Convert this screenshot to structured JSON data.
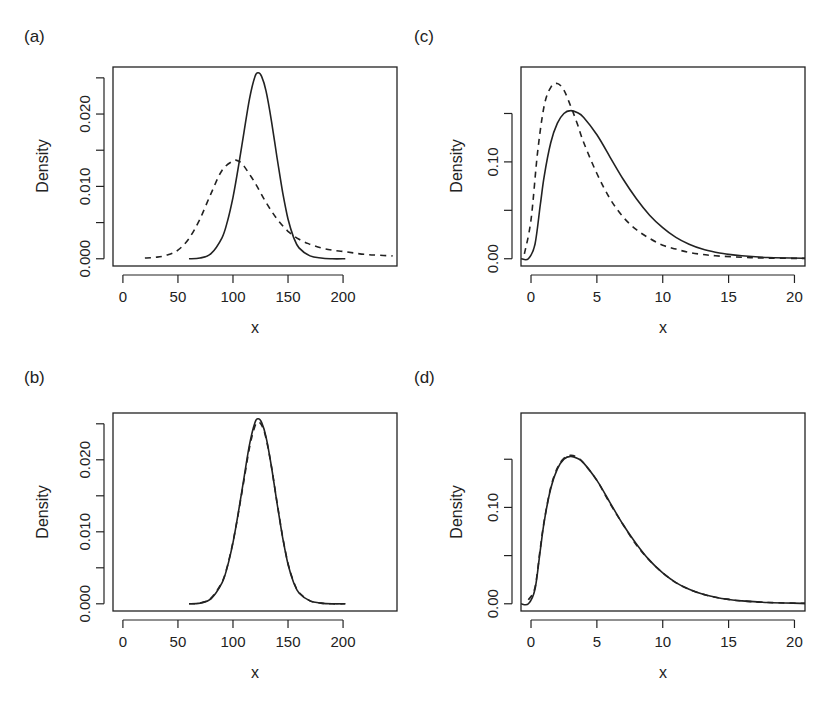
{
  "figure": {
    "panels": [
      {
        "id": "a",
        "label": "(a)",
        "xlabel": "x",
        "ylabel": "Density"
      },
      {
        "id": "b",
        "label": "(b)",
        "xlabel": "x",
        "ylabel": "Density"
      },
      {
        "id": "c",
        "label": "(c)",
        "xlabel": "x",
        "ylabel": "Density"
      },
      {
        "id": "d",
        "label": "(d)",
        "xlabel": "x",
        "ylabel": "Density"
      }
    ]
  },
  "chart_data": [
    {
      "panel": "(a)",
      "type": "line",
      "title": "",
      "xlabel": "x",
      "ylabel": "Density",
      "xlim": [
        -9,
        249
      ],
      "ylim": [
        -0.001,
        0.0265
      ],
      "xticks": [
        0,
        50,
        100,
        150,
        200
      ],
      "xtick_labels": [
        "0",
        "50",
        "100",
        "150",
        "200"
      ],
      "yticks": [
        0.0,
        0.005,
        0.01,
        0.015,
        0.02,
        0.025
      ],
      "ytick_labels": [
        "0.000",
        "",
        "0.010",
        "",
        "0.020",
        ""
      ],
      "grid": false,
      "series": [
        {
          "name": "solid",
          "style": "solid",
          "x": [
            60,
            70,
            80,
            90,
            95,
            100,
            105,
            110,
            115,
            120,
            123,
            126,
            130,
            135,
            140,
            145,
            150,
            155,
            160,
            170,
            180,
            190,
            202
          ],
          "y": [
            0.0,
            0.0001,
            0.0007,
            0.0029,
            0.0052,
            0.0085,
            0.0128,
            0.0175,
            0.0221,
            0.0252,
            0.0257,
            0.0252,
            0.0232,
            0.019,
            0.014,
            0.0093,
            0.0055,
            0.003,
            0.0015,
            0.0004,
            0.0001,
            0.0,
            0.0
          ]
        },
        {
          "name": "dashed",
          "style": "dashed",
          "x": [
            20,
            30,
            40,
            50,
            60,
            70,
            80,
            90,
            100,
            105,
            110,
            120,
            130,
            140,
            150,
            160,
            170,
            180,
            190,
            200,
            210,
            220,
            230,
            245
          ],
          "y": [
            0.0001,
            0.0002,
            0.0005,
            0.0012,
            0.0028,
            0.0055,
            0.009,
            0.0122,
            0.0135,
            0.0135,
            0.0128,
            0.0105,
            0.0078,
            0.0055,
            0.0038,
            0.0027,
            0.002,
            0.0015,
            0.0012,
            0.001,
            0.0008,
            0.0006,
            0.0005,
            0.0004
          ]
        }
      ]
    },
    {
      "panel": "(b)",
      "type": "line",
      "title": "",
      "xlabel": "x",
      "ylabel": "Density",
      "xlim": [
        -9,
        249
      ],
      "ylim": [
        -0.001,
        0.0265
      ],
      "xticks": [
        0,
        50,
        100,
        150,
        200
      ],
      "xtick_labels": [
        "0",
        "50",
        "100",
        "150",
        "200"
      ],
      "yticks": [
        0.0,
        0.005,
        0.01,
        0.015,
        0.02,
        0.025
      ],
      "ytick_labels": [
        "0.000",
        "",
        "0.010",
        "",
        "0.020",
        ""
      ],
      "grid": false,
      "series": [
        {
          "name": "solid",
          "style": "solid",
          "x": [
            60,
            70,
            80,
            90,
            95,
            100,
            105,
            110,
            115,
            120,
            123,
            126,
            130,
            135,
            140,
            145,
            150,
            155,
            160,
            170,
            180,
            190,
            202
          ],
          "y": [
            0.0,
            0.0001,
            0.0007,
            0.0029,
            0.0052,
            0.0085,
            0.0128,
            0.0175,
            0.0221,
            0.0252,
            0.0257,
            0.0252,
            0.0232,
            0.019,
            0.014,
            0.0093,
            0.0055,
            0.003,
            0.0015,
            0.0004,
            0.0001,
            0.0,
            0.0
          ]
        },
        {
          "name": "dashed",
          "style": "dashed",
          "x": [
            60,
            70,
            80,
            90,
            95,
            100,
            105,
            110,
            115,
            120,
            123,
            126,
            130,
            135,
            140,
            145,
            150,
            155,
            160,
            170,
            180,
            190,
            202
          ],
          "y": [
            0.0,
            0.0001,
            0.0008,
            0.003,
            0.0053,
            0.0086,
            0.0127,
            0.0172,
            0.0217,
            0.0247,
            0.0252,
            0.0248,
            0.023,
            0.019,
            0.0141,
            0.0094,
            0.0056,
            0.0031,
            0.0016,
            0.0004,
            0.0001,
            0.0,
            0.0
          ]
        }
      ]
    },
    {
      "panel": "(c)",
      "type": "line",
      "title": "",
      "xlabel": "x",
      "ylabel": "Density",
      "xlim": [
        -0.76,
        20.8
      ],
      "ylim": [
        -0.0075,
        0.198
      ],
      "xticks": [
        0,
        5,
        10,
        15,
        20
      ],
      "xtick_labels": [
        "0",
        "5",
        "10",
        "15",
        "20"
      ],
      "yticks": [
        0.0,
        0.05,
        0.1,
        0.15
      ],
      "ytick_labels": [
        "0.00",
        "",
        "0.10",
        ""
      ],
      "grid": false,
      "series": [
        {
          "name": "solid",
          "style": "solid",
          "x": [
            -0.75,
            -0.2,
            0.3,
            0.7,
            1.0,
            1.5,
            2.0,
            2.5,
            3.0,
            3.5,
            4.0,
            5.0,
            6.0,
            7.0,
            8.0,
            9.0,
            10.0,
            11.0,
            12.0,
            13.0,
            14.0,
            15.0,
            16.0,
            18.0,
            20.8
          ],
          "y": [
            0.0,
            0.0,
            0.015,
            0.055,
            0.085,
            0.12,
            0.14,
            0.15,
            0.153,
            0.151,
            0.146,
            0.128,
            0.105,
            0.082,
            0.062,
            0.045,
            0.032,
            0.022,
            0.015,
            0.01,
            0.0068,
            0.0045,
            0.003,
            0.0013,
            0.0004
          ]
        },
        {
          "name": "dashed",
          "style": "dashed",
          "x": [
            -0.5,
            0.0,
            0.5,
            1.0,
            1.5,
            2.0,
            2.5,
            3.0,
            3.5,
            4.0,
            5.0,
            6.0,
            7.0,
            8.0,
            9.0,
            10.0,
            11.0,
            12.0,
            13.0,
            14.0,
            16.0,
            18.0,
            20.8
          ],
          "y": [
            0.005,
            0.04,
            0.11,
            0.158,
            0.177,
            0.181,
            0.174,
            0.158,
            0.14,
            0.12,
            0.088,
            0.062,
            0.043,
            0.03,
            0.021,
            0.014,
            0.01,
            0.0065,
            0.0045,
            0.003,
            0.0015,
            0.0007,
            0.0003
          ]
        }
      ]
    },
    {
      "panel": "(d)",
      "type": "line",
      "title": "",
      "xlabel": "x",
      "ylabel": "Density",
      "xlim": [
        -0.76,
        20.8
      ],
      "ylim": [
        -0.0075,
        0.198
      ],
      "xticks": [
        0,
        5,
        10,
        15,
        20
      ],
      "xtick_labels": [
        "0",
        "5",
        "10",
        "15",
        "20"
      ],
      "yticks": [
        0.0,
        0.05,
        0.1,
        0.15
      ],
      "ytick_labels": [
        "0.00",
        "",
        "0.10",
        ""
      ],
      "grid": false,
      "series": [
        {
          "name": "solid",
          "style": "solid",
          "x": [
            -0.75,
            -0.2,
            0.3,
            0.7,
            1.0,
            1.5,
            2.0,
            2.5,
            3.0,
            3.5,
            4.0,
            5.0,
            6.0,
            7.0,
            8.0,
            9.0,
            10.0,
            11.0,
            12.0,
            13.0,
            14.0,
            15.0,
            16.0,
            18.0,
            20.8
          ],
          "y": [
            0.0,
            0.0,
            0.015,
            0.055,
            0.085,
            0.12,
            0.14,
            0.15,
            0.153,
            0.151,
            0.146,
            0.128,
            0.105,
            0.082,
            0.062,
            0.045,
            0.032,
            0.022,
            0.015,
            0.01,
            0.0068,
            0.0045,
            0.003,
            0.0013,
            0.0004
          ]
        },
        {
          "name": "dashed",
          "style": "dashed",
          "x": [
            -0.2,
            0.3,
            0.7,
            1.0,
            1.5,
            2.0,
            2.5,
            3.0,
            3.5,
            4.0,
            5.0,
            6.0,
            7.0,
            8.0,
            9.0,
            10.0,
            11.0,
            12.0,
            13.0,
            14.0,
            15.0,
            16.0,
            18.0,
            20.8
          ],
          "y": [
            0.004,
            0.017,
            0.057,
            0.086,
            0.121,
            0.141,
            0.151,
            0.154,
            0.152,
            0.146,
            0.128,
            0.104,
            0.082,
            0.061,
            0.045,
            0.032,
            0.022,
            0.015,
            0.01,
            0.0067,
            0.0045,
            0.003,
            0.0013,
            0.0004
          ]
        }
      ]
    }
  ]
}
